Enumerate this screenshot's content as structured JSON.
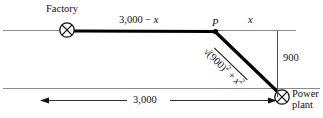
{
  "diagram": {
    "labels": {
      "factory": "Factory",
      "point_p": "P",
      "segment_left": "3,000 − ",
      "segment_left_var": "x",
      "segment_right": "x",
      "hypotenuse_radical": "√",
      "hypotenuse_inner": "(900)",
      "hypotenuse_exp1": "2",
      "hypotenuse_plus": " + ",
      "hypotenuse_var": "x",
      "hypotenuse_exp2": "2",
      "vertical_dimension": "900",
      "horizontal_dimension": "3,000",
      "power_plant": "Power plant"
    },
    "values": {
      "bank_separation": 900,
      "total_distance": 3000,
      "river_width_label": "900",
      "baseline_label": "3,000"
    },
    "colors": {
      "bank_line": "#8a8a8a",
      "cable": "#000000",
      "dimension_line": "#3a3a3a",
      "text": "#111111",
      "background": "#ffffff"
    },
    "geometry": {
      "top_bank_y": 30,
      "bottom_bank_y": 88,
      "factory_x": 67,
      "point_p_x": 215,
      "power_plant_x": 282,
      "power_plant_y": 97
    }
  }
}
